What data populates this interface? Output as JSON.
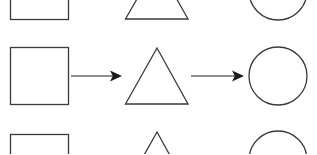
{
  "page": {
    "background_color": "#ffffff",
    "width": 317,
    "height": 154
  },
  "style": {
    "shape_stroke_color": "#3a3a3a",
    "shape_stroke_width": 1.3,
    "arrow_color": "#1c1c1c",
    "arrow_stroke_width": 1.2,
    "fill": "none"
  },
  "diagram": {
    "type": "shape-flow",
    "rows": [
      {
        "id": "row-top",
        "clipped": "top",
        "y_center": -10,
        "shapes": [
          {
            "name": "square",
            "x": 10,
            "y": -38,
            "width": 58,
            "height": 57
          },
          {
            "name": "triangle",
            "apex_x": 157,
            "apex_y": -36,
            "base_left_x": 125,
            "base_right_x": 188,
            "base_y": 19
          },
          {
            "name": "circle",
            "cx": 278,
            "cy": -9,
            "r": 29
          }
        ],
        "arrows": []
      },
      {
        "id": "row-middle",
        "clipped": "none",
        "y_center": 76,
        "shapes": [
          {
            "name": "square",
            "x": 10,
            "y": 47,
            "width": 58,
            "height": 57
          },
          {
            "name": "triangle",
            "apex_x": 157,
            "apex_y": 48,
            "base_left_x": 125,
            "base_right_x": 188,
            "base_y": 104
          },
          {
            "name": "circle",
            "cx": 278,
            "cy": 76,
            "r": 29
          }
        ],
        "arrows": [
          {
            "name": "arrow-square-to-triangle",
            "x1": 71,
            "y1": 76,
            "x2": 122,
            "y2": 76,
            "direction": "right"
          },
          {
            "name": "arrow-triangle-to-circle",
            "x1": 191,
            "y1": 76,
            "x2": 244,
            "y2": 76,
            "direction": "right"
          }
        ]
      },
      {
        "id": "row-bottom",
        "clipped": "bottom",
        "y_center": 163,
        "shapes": [
          {
            "name": "square",
            "x": 10,
            "y": 134,
            "width": 58,
            "height": 57
          },
          {
            "name": "triangle",
            "apex_x": 157,
            "apex_y": 132,
            "base_left_x": 125,
            "base_right_x": 188,
            "base_y": 188
          },
          {
            "name": "circle",
            "cx": 278,
            "cy": 160,
            "r": 29
          }
        ],
        "arrows": []
      }
    ]
  }
}
